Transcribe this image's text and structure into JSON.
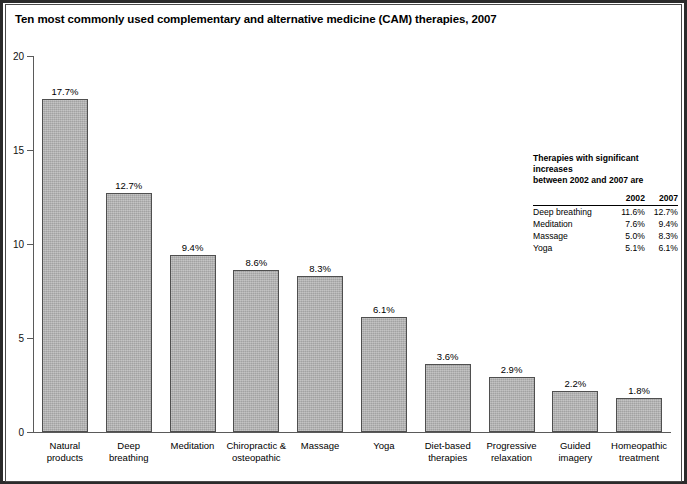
{
  "title": "Ten most commonly used complementary and alternative medicine (CAM) therapies, 2007",
  "chart_data": {
    "type": "bar",
    "title": "Ten most commonly used complementary and alternative medicine (CAM) therapies, 2007",
    "xlabel": "",
    "ylabel": "",
    "ylim": [
      0,
      20
    ],
    "yticks": [
      "0",
      "5",
      "10",
      "15",
      "20"
    ],
    "grid": false,
    "legend": "none",
    "bar_color": "#b3b3b3",
    "bar_edge_color": "#4f4f4f",
    "categories": [
      "Natural products",
      "Deep breathing",
      "Meditation",
      "Chiropractic & osteopathic",
      "Massage",
      "Yoga",
      "Diet-based therapies",
      "Progressive relaxation",
      "Guided imagery",
      "Homeopathic treatment"
    ],
    "category_lines": [
      [
        "Natural",
        "products"
      ],
      [
        "Deep",
        "breathing"
      ],
      [
        "Meditation"
      ],
      [
        "Chiropractic &",
        "osteopathic"
      ],
      [
        "Massage"
      ],
      [
        "Yoga"
      ],
      [
        "Diet-based",
        "therapies"
      ],
      [
        "Progressive",
        "relaxation"
      ],
      [
        "Guided",
        "imagery"
      ],
      [
        "Homeopathic",
        "treatment"
      ]
    ],
    "values": [
      17.7,
      12.7,
      9.4,
      8.6,
      8.3,
      6.1,
      3.6,
      2.9,
      2.2,
      1.8
    ],
    "value_labels": [
      "17.7%",
      "12.7%",
      "9.4%",
      "8.6%",
      "8.3%",
      "6.1%",
      "3.6%",
      "2.9%",
      "2.2%",
      "1.8%"
    ]
  },
  "note": {
    "title_line1": "Therapies with significant increases",
    "title_line2": "between 2002 and 2007 are",
    "columns": [
      "",
      "2002",
      "2007"
    ],
    "rows": [
      {
        "name": "Deep breathing",
        "v2002": "11.6%",
        "v2007": "12.7%"
      },
      {
        "name": "Meditation",
        "v2002": "7.6%",
        "v2007": "9.4%"
      },
      {
        "name": "Massage",
        "v2002": "5.0%",
        "v2007": "8.3%"
      },
      {
        "name": "Yoga",
        "v2002": "5.1%",
        "v2007": "6.1%"
      }
    ]
  },
  "caption": {
    "text": ""
  }
}
